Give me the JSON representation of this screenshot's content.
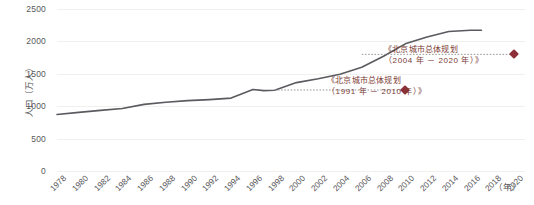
{
  "chart_data": {
    "type": "line",
    "title": "",
    "xlabel": "（年）",
    "ylabel": "人口（万人）",
    "ylim": [
      0,
      2500
    ],
    "xlim": [
      1978,
      2021
    ],
    "grid": true,
    "legend": "none",
    "ytick_labels": [
      "2500",
      "2000",
      "1500",
      "1000",
      "500",
      "0"
    ],
    "ytick_values": [
      2500,
      2000,
      1500,
      1000,
      500,
      0
    ],
    "xtick_labels": [
      "1978",
      "1980",
      "1982",
      "1984",
      "1986",
      "1988",
      "1990",
      "1992",
      "1994",
      "1996",
      "1998",
      "2000",
      "2002",
      "2004",
      "2006",
      "2008",
      "2010",
      "2012",
      "2014",
      "2016",
      "2018",
      "2020"
    ],
    "xtick_values": [
      1978,
      1980,
      1982,
      1984,
      1986,
      1988,
      1990,
      1992,
      1994,
      1996,
      1998,
      2000,
      2002,
      2004,
      2006,
      2008,
      2010,
      2012,
      2014,
      2016,
      2018,
      2020
    ],
    "series": [
      {
        "name": "北京常住人口",
        "color": "#5a5a5f",
        "x": [
          1978,
          1980,
          1982,
          1984,
          1986,
          1988,
          1990,
          1992,
          1994,
          1996,
          1997,
          1998,
          2000,
          2002,
          2004,
          2006,
          2008,
          2010,
          2012,
          2014,
          2016,
          2017
        ],
        "values": [
          872,
          904,
          935,
          965,
          1028,
          1061,
          1086,
          1102,
          1125,
          1259,
          1240,
          1245,
          1364,
          1423,
          1493,
          1601,
          1771,
          1962,
          2069,
          2152,
          2173,
          2171
        ]
      }
    ],
    "annotations": [
      {
        "id": "plan-2004-2020",
        "line1": "《北京城市总体规划",
        "line2": "（2004 年 － 2020 年）》",
        "marker_x": 2020,
        "marker_y": 1800,
        "color": "#8e2f38"
      },
      {
        "id": "plan-1991-2010",
        "line1": "《北京城市总体规划",
        "line2": "（1991 年 － 2010 年）》",
        "marker_x": 2010,
        "marker_y": 1250,
        "color": "#8e2f38"
      }
    ],
    "reference_lines": [
      {
        "id": "ref-plan-2004-2020",
        "y": 1800,
        "x_from": 2006,
        "x_to": 2020,
        "style": "dotted"
      },
      {
        "id": "ref-plan-1991-2010",
        "y": 1250,
        "x_from": 1998,
        "x_to": 2010,
        "style": "dotted"
      }
    ]
  },
  "axis": {
    "y_title": "人口（万人）",
    "x_unit": "（年）"
  }
}
